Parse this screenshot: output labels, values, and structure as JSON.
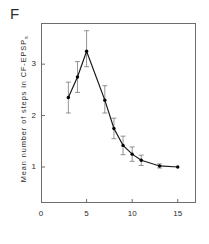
{
  "panel": {
    "label": "F"
  },
  "chart_data": {
    "type": "line",
    "title": "",
    "subtitle": "",
    "xlabel": "",
    "ylabel": "Mean number of steps in CF-EPSPs",
    "ylabel_main": "Mean number of steps in CF-EPSP",
    "ylabel_sub": "s",
    "xlim": [
      0,
      17
    ],
    "ylim": [
      0.3,
      3.8
    ],
    "xticks": [
      0,
      5,
      10,
      15
    ],
    "xtick_labels": [
      "0",
      "5",
      "10",
      "15"
    ],
    "yticks": [
      1,
      2,
      3
    ],
    "ytick_labels": [
      "1",
      "2",
      "3"
    ],
    "grid": false,
    "legend": "none",
    "marker": "filled-circle",
    "errorbars": "vertical-sd",
    "x": [
      3,
      4,
      5,
      7,
      8,
      9,
      10,
      11,
      13,
      15
    ],
    "values": [
      2.35,
      2.75,
      3.25,
      2.3,
      1.75,
      1.42,
      1.25,
      1.13,
      1.02,
      1.0
    ],
    "err_low": [
      0.3,
      0.3,
      0.3,
      0.25,
      0.2,
      0.18,
      0.14,
      0.1,
      0.04,
      0.0
    ],
    "err_high": [
      0.3,
      0.3,
      0.4,
      0.28,
      0.2,
      0.18,
      0.14,
      0.1,
      0.04,
      0.0
    ],
    "colors": {
      "line": "#1a1a1a",
      "marker": "#000000",
      "error": "#7a7a7a",
      "axis": "#6d6d6d"
    }
  }
}
